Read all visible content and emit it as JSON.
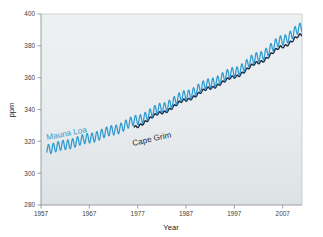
{
  "chart_data": {
    "type": "line",
    "title": "",
    "xlabel": "Year",
    "ylabel": "ppm",
    "xlim": [
      1957,
      2011
    ],
    "ylim": [
      280,
      400
    ],
    "xticks": [
      1957,
      1967,
      1977,
      1987,
      1997,
      2007
    ],
    "yticks": [
      280,
      300,
      320,
      340,
      360,
      380,
      400
    ],
    "grid": false,
    "legend": "inline-annotations",
    "plot_background": "#e8ecee",
    "annotations": [
      {
        "text": "Mauna Loa",
        "x": 1961.5,
        "y": 324.5,
        "rotation": -11,
        "color": "#2e9ad0"
      },
      {
        "text": "Cape Grim",
        "x": 1979.0,
        "y": 325.5,
        "rotation": -13,
        "color": "#1b2a45"
      }
    ],
    "series": [
      {
        "name": "Mauna Loa",
        "color": "#2e9ad0",
        "seasonal_amplitude": 3.0,
        "x_start": 1958.2,
        "x_end": 2011.0,
        "trend_points": [
          {
            "x": 1958.2,
            "y": 315.0
          },
          {
            "x": 1962.0,
            "y": 317.8
          },
          {
            "x": 1967.0,
            "y": 322.0
          },
          {
            "x": 1972.0,
            "y": 327.0
          },
          {
            "x": 1977.0,
            "y": 333.5
          },
          {
            "x": 1982.0,
            "y": 341.0
          },
          {
            "x": 1987.0,
            "y": 349.0
          },
          {
            "x": 1992.0,
            "y": 356.5
          },
          {
            "x": 1997.0,
            "y": 363.5
          },
          {
            "x": 2002.0,
            "y": 373.0
          },
          {
            "x": 2007.0,
            "y": 383.5
          },
          {
            "x": 2011.0,
            "y": 391.5
          }
        ]
      },
      {
        "name": "Cape Grim",
        "color": "#1b2a45",
        "seasonal_amplitude": 0.75,
        "x_start": 1976.3,
        "x_end": 2011.0,
        "trend_points": [
          {
            "x": 1976.3,
            "y": 329.0
          },
          {
            "x": 1982.0,
            "y": 338.0
          },
          {
            "x": 1987.0,
            "y": 346.0
          },
          {
            "x": 1992.0,
            "y": 353.5
          },
          {
            "x": 1997.0,
            "y": 360.5
          },
          {
            "x": 2002.0,
            "y": 369.5
          },
          {
            "x": 2007.0,
            "y": 379.5
          },
          {
            "x": 2011.0,
            "y": 387.0
          }
        ]
      }
    ]
  },
  "axes": {
    "y_title": "ppm",
    "x_title": "Year",
    "y_tick_labels": [
      "400",
      "380",
      "360",
      "340",
      "320",
      "300",
      "280"
    ],
    "x_tick_labels": [
      "1957",
      "1967",
      "1977",
      "1987",
      "1997",
      "2007"
    ]
  },
  "labels": {
    "mauna_loa": "Mauna Loa",
    "cape_grim": "Cape Grim"
  },
  "colors": {
    "mauna_loa": "#2e9ad0",
    "cape_grim": "#1b2a45",
    "plot_bg_top": "#eceff1",
    "plot_bg_bottom": "#dfe4e6",
    "axis": "#9aa0a3",
    "tick_text": "#3c3c3c",
    "page_bg": "#ffffff"
  }
}
